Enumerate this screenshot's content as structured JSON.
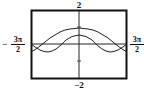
{
  "chart_data": {
    "type": "line",
    "title": "",
    "xlabel": "",
    "ylabel": "",
    "xlim": [
      "-3π/2",
      "3π/2"
    ],
    "ylim": [
      -2,
      2
    ],
    "grid": false,
    "legend": null,
    "tick_labels": {
      "x_min": {
        "sign": "−",
        "num": "3π",
        "den": "2"
      },
      "x_max": {
        "num": "3π",
        "den": "2"
      },
      "y_max": "2",
      "y_min": "−2"
    },
    "series": [
      {
        "name": "curve-upper",
        "x": [
          -4.712,
          -3.927,
          -3.142,
          -2.356,
          -1.571,
          -0.785,
          0,
          0.785,
          1.571,
          2.356,
          3.142,
          3.927,
          4.712
        ],
        "y": [
          -0.45,
          -0.2,
          0.2,
          0.55,
          0.85,
          0.95,
          0.95,
          0.95,
          0.85,
          0.55,
          0.2,
          -0.2,
          -0.45
        ]
      },
      {
        "name": "curve-lower",
        "x": [
          -4.712,
          -3.927,
          -3.142,
          -2.356,
          -1.571,
          -0.785,
          0,
          0.785,
          1.571,
          2.356,
          3.142,
          3.927,
          4.712
        ],
        "y": [
          0.0,
          -0.35,
          -0.45,
          -0.3,
          0.1,
          0.4,
          0.55,
          0.4,
          0.1,
          -0.3,
          -0.45,
          -0.35,
          0.0
        ]
      }
    ]
  },
  "layout": {
    "frame": {
      "x": 31,
      "y": 10,
      "w": 96,
      "h": 69
    },
    "pixel_series": [
      [
        [
          31,
          52
        ],
        [
          36,
          49
        ],
        [
          40,
          46
        ],
        [
          45,
          42
        ],
        [
          50,
          38
        ],
        [
          55,
          35
        ],
        [
          60,
          32
        ],
        [
          65,
          30
        ],
        [
          70,
          29
        ],
        [
          79,
          28
        ],
        [
          88,
          29
        ],
        [
          93,
          30
        ],
        [
          98,
          32
        ],
        [
          103,
          35
        ],
        [
          108,
          38
        ],
        [
          113,
          42
        ],
        [
          118,
          46
        ],
        [
          122,
          49
        ],
        [
          127,
          52
        ]
      ],
      [
        [
          31,
          44
        ],
        [
          35,
          47
        ],
        [
          40,
          50
        ],
        [
          44,
          51.5
        ],
        [
          48,
          52
        ],
        [
          52,
          51
        ],
        [
          56,
          49
        ],
        [
          61,
          45
        ],
        [
          66,
          40
        ],
        [
          72,
          36.5
        ],
        [
          79,
          35
        ],
        [
          86,
          36.5
        ],
        [
          92,
          40
        ],
        [
          97,
          45
        ],
        [
          102,
          49
        ],
        [
          106,
          51
        ],
        [
          110,
          52
        ],
        [
          114,
          51.5
        ],
        [
          118,
          50
        ],
        [
          123,
          47
        ],
        [
          127,
          44
        ]
      ]
    ]
  }
}
